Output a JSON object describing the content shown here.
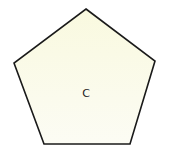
{
  "diagram": {
    "shape": "pentagon",
    "label": "C",
    "colors": {
      "fill": "#fbfbe8",
      "stroke": "#1a1a1a",
      "background": "#ffffff"
    },
    "vertices": [
      [
        86,
        9
      ],
      [
        155,
        61
      ],
      [
        130,
        144
      ],
      [
        44,
        144
      ],
      [
        14,
        63
      ]
    ]
  }
}
